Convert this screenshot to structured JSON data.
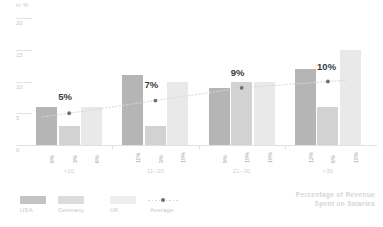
{
  "chart_data": {
    "type": "bar",
    "title": "",
    "subtitle": "",
    "xlabel": "",
    "ylabel": "in %",
    "ylim": [
      0,
      20
    ],
    "yticks": [
      0,
      5,
      10,
      15,
      20
    ],
    "ytick_labels": [
      "0",
      "5",
      "10",
      "15",
      "20"
    ],
    "grid": false,
    "legend_position": "bottom-left",
    "categories": [
      "<10",
      "11–20",
      "21–30",
      ">30"
    ],
    "series": [
      {
        "name": "USA",
        "color": "#b5b5b5",
        "values": [
          6,
          11,
          9,
          12
        ],
        "value_labels": [
          "6%",
          "11%",
          "9%",
          "12%"
        ]
      },
      {
        "name": "Germany",
        "color": "#d2d2d2",
        "values": [
          3,
          3,
          10,
          6
        ],
        "value_labels": [
          "3%",
          "3%",
          "10%",
          "6%"
        ]
      },
      {
        "name": "UK",
        "color": "#e9e9e9",
        "values": [
          6,
          10,
          10,
          15
        ],
        "value_labels": [
          "6%",
          "10%",
          "10%",
          "15%"
        ]
      }
    ],
    "overlay": {
      "name": "Average",
      "type": "line",
      "style": "dotted",
      "marker": "dot",
      "color": "#6f6f6f",
      "line_color": "#d8d8d8",
      "values": [
        5,
        7,
        9,
        10
      ],
      "value_labels": [
        "5%",
        "7%",
        "9%",
        "10%"
      ]
    },
    "annotation": "Percentage of Revenue Spent on Salaries"
  },
  "axis": {
    "unit_label": "in %",
    "ticks": [
      {
        "value": 20,
        "label": "20"
      },
      {
        "value": 15,
        "label": "15"
      },
      {
        "value": 10,
        "label": "10"
      },
      {
        "value": 5,
        "label": "5"
      },
      {
        "value": 0,
        "label": "0"
      }
    ]
  },
  "groups": [
    {
      "name": "<10",
      "bars": [
        {
          "series": "USA",
          "label": "6%"
        },
        {
          "series": "Germany",
          "label": "3%"
        },
        {
          "series": "UK",
          "label": "6%"
        }
      ],
      "average_label": "5%"
    },
    {
      "name": "11–20",
      "bars": [
        {
          "series": "USA",
          "label": "11%"
        },
        {
          "series": "Germany",
          "label": "3%"
        },
        {
          "series": "UK",
          "label": "10%"
        }
      ],
      "average_label": "7%"
    },
    {
      "name": "21–30",
      "bars": [
        {
          "series": "USA",
          "label": "9%"
        },
        {
          "series": "Germany",
          "label": "10%"
        },
        {
          "series": "UK",
          "label": "10%"
        }
      ],
      "average_label": "9%"
    },
    {
      "name": ">30",
      "bars": [
        {
          "series": "USA",
          "label": "12%"
        },
        {
          "series": "Germany",
          "label": "6%"
        },
        {
          "series": "UK",
          "label": "15%"
        }
      ],
      "average_label": "10%"
    }
  ],
  "legend": {
    "items": [
      {
        "label": "USA",
        "color": "#c3c3c3"
      },
      {
        "label": "Germany",
        "color": "#dcdcdc"
      },
      {
        "label": "UK",
        "color": "#eeeeee"
      },
      {
        "label": "Average",
        "color": "#6f6f6f"
      }
    ]
  },
  "caption": {
    "line1": "Percentage of Revenue",
    "line2": "Spent on Salaries"
  }
}
